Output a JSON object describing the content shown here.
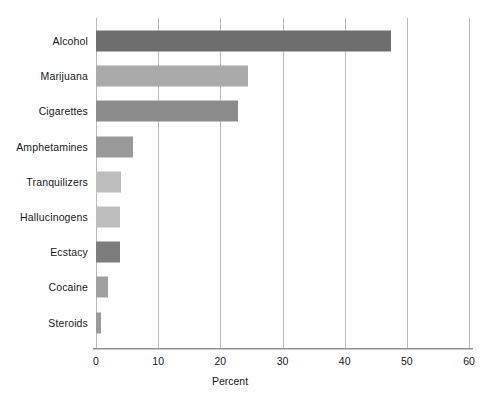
{
  "chart_data": {
    "type": "bar",
    "orientation": "horizontal",
    "title": "",
    "xlabel": "Percent",
    "ylabel": "",
    "xlim": [
      0,
      60
    ],
    "xticks": [
      0,
      10,
      20,
      30,
      40,
      50,
      60
    ],
    "xtick_labels": [
      "0",
      "10",
      "20",
      "30",
      "40",
      "50",
      "60"
    ],
    "grid": "vertical",
    "legend": "none",
    "categories": [
      "Alcohol",
      "Marijuana",
      "Cigarettes",
      "Amphetamines",
      "Tranquilizers",
      "Hallucinogens",
      "Ecstacy",
      "Cocaine",
      "Steroids"
    ],
    "values": [
      47.5,
      24.5,
      22.8,
      6.0,
      4.1,
      3.8,
      3.9,
      1.9,
      0.8
    ],
    "bar_colors": [
      "#6e6e6e",
      "#aaaaaa",
      "#8c8c8c",
      "#999999",
      "#bdbdbd",
      "#bdbdbd",
      "#7d7d7d",
      "#a0a0a0",
      "#9a9a9a"
    ],
    "gridline_color": "#b9b9b9",
    "axis_color": "#8f8f8f",
    "background": "#ffffff",
    "text_color": "#15181c"
  }
}
